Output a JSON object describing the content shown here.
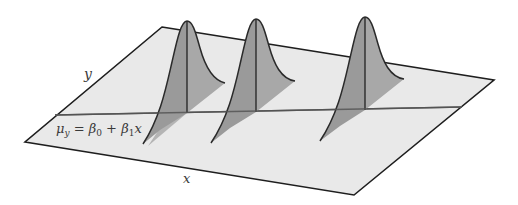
{
  "diagram": {
    "type": "3d-regression-plane",
    "colors": {
      "background": "#ffffff",
      "plane_fill": "#e9e9e9",
      "plane_edge": "#1e1e1e",
      "regression_line": "#555555",
      "curve_fill_dark": "#9a9a9a",
      "curve_fill_light": "#b4b4b4",
      "curve_stroke": "#2a2a2a",
      "label": "#3a3a3a"
    },
    "plane": {
      "corners": {
        "back_left": [
          162,
          27
        ],
        "front_left": [
          25,
          142
        ],
        "front_right": [
          354,
          195
        ],
        "back_right": [
          494,
          80
        ]
      }
    },
    "axes": {
      "x_label": "x",
      "y_label": "y"
    },
    "regression_line": {
      "label": "μy = β0 + β1x",
      "label_parts": {
        "mu": "μ",
        "mu_sub": "y",
        "equals": " = ",
        "beta0": "β",
        "beta0_sub": "0",
        "plus": " + ",
        "beta1": "β",
        "beta1_sub": "1",
        "x": "x"
      },
      "start": [
        55,
        115
      ],
      "end": [
        462,
        107
      ]
    },
    "distributions": [
      {
        "name": "normal-curve-1",
        "mean_point": [
          187,
          113
        ],
        "peak": [
          187,
          21
        ],
        "height": 92
      },
      {
        "name": "normal-curve-2",
        "mean_point": [
          256,
          112
        ],
        "peak": [
          256,
          19
        ],
        "height": 93
      },
      {
        "name": "normal-curve-3",
        "mean_point": [
          365,
          110
        ],
        "peak": [
          365,
          17
        ],
        "height": 93
      }
    ]
  }
}
